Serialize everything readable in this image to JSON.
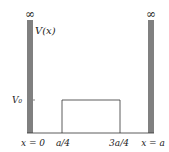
{
  "diagram": {
    "type": "potential-well-with-barrier",
    "labels": {
      "left_infinity": "∞",
      "right_infinity": "∞",
      "potential_label": "V(x)",
      "barrier_height": "V₀",
      "x_left_wall": "x = 0",
      "barrier_start": "a/4",
      "barrier_end": "3a/4",
      "x_right_wall": "x = a"
    },
    "colors": {
      "wall_fill": "#808080",
      "line": "#333333",
      "background": "#ffffff"
    }
  }
}
